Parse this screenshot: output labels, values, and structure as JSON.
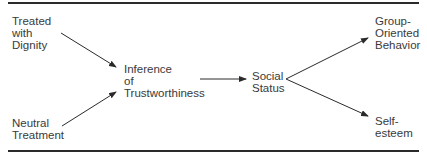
{
  "diagram": {
    "type": "path-model",
    "nodes": [
      {
        "id": "treated-with-dignity",
        "label": "Treated\nwith\nDignity"
      },
      {
        "id": "neutral-treatment",
        "label": "Neutral\nTreatment"
      },
      {
        "id": "inference-of-trustworthiness",
        "label": "Inference\nof\nTrustworthiness"
      },
      {
        "id": "social-status",
        "label": "Social\nStatus"
      },
      {
        "id": "group-oriented-behavior",
        "label": "Group-\nOriented\nBehavior"
      },
      {
        "id": "self-esteem",
        "label": "Self-\nesteem"
      }
    ],
    "edges": [
      {
        "from": "treated-with-dignity",
        "to": "inference-of-trustworthiness"
      },
      {
        "from": "neutral-treatment",
        "to": "inference-of-trustworthiness"
      },
      {
        "from": "inference-of-trustworthiness",
        "to": "social-status"
      },
      {
        "from": "social-status",
        "to": "group-oriented-behavior"
      },
      {
        "from": "social-status",
        "to": "self-esteem"
      }
    ],
    "colors": {
      "text": "#3a3a3a",
      "line": "#2a2a2a"
    }
  }
}
